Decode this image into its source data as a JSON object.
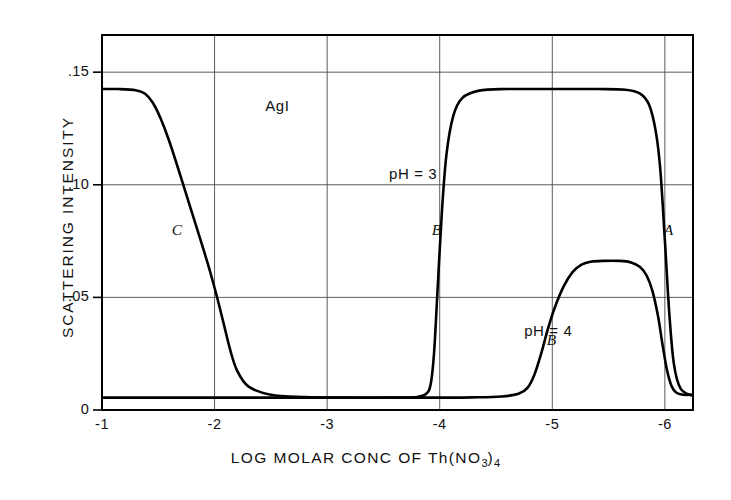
{
  "chart_data": {
    "type": "line",
    "title": "AgI",
    "xlabel": "LOG MOLAR CONC OF Th(NO3)4",
    "xlabel_main": "LOG MOLAR CONC OF  Th(NO",
    "xlabel_sub1": "3",
    "xlabel_mid": ")",
    "xlabel_sub2": "4",
    "ylabel": "SCATTERING INTENSITY",
    "xlim": [
      -1,
      -6.25
    ],
    "ylim": [
      0,
      0.1665
    ],
    "grid": true,
    "legend_position": "none",
    "xticks": [
      -1,
      -2,
      -3,
      -4,
      -5,
      -6
    ],
    "xtick_labels": [
      "-1",
      "-2",
      "-3",
      "-4",
      "-5",
      "-6"
    ],
    "yticks": [
      0,
      0.05,
      0.1,
      0.15
    ],
    "ytick_labels": [
      "0",
      ".05",
      ".10",
      ".15"
    ],
    "series": [
      {
        "name": "pH = 3",
        "label": "pH = 3",
        "color": "#000000",
        "x": [
          -1.0,
          -1.15,
          -1.3,
          -1.38,
          -1.45,
          -1.52,
          -1.6,
          -1.7,
          -1.8,
          -1.9,
          -1.96,
          -2.02,
          -2.08,
          -2.14,
          -2.2,
          -2.3,
          -2.5,
          -2.8,
          -3.2,
          -3.6,
          -3.8,
          -3.88,
          -3.92,
          -3.95,
          -3.98,
          -4.02,
          -4.06,
          -4.12,
          -4.2,
          -4.35,
          -4.6,
          -5.0,
          -5.4,
          -5.65,
          -5.78,
          -5.86,
          -5.92,
          -5.96,
          -6.0,
          -6.04,
          -6.08,
          -6.14,
          -6.25
        ],
        "y": [
          0.1425,
          0.1425,
          0.142,
          0.1405,
          0.1365,
          0.1295,
          0.119,
          0.1035,
          0.0875,
          0.0715,
          0.0615,
          0.0505,
          0.0385,
          0.0265,
          0.0175,
          0.0105,
          0.0068,
          0.0058,
          0.0055,
          0.0055,
          0.0058,
          0.0072,
          0.0115,
          0.0255,
          0.0525,
          0.0885,
          0.1135,
          0.1305,
          0.1385,
          0.1418,
          0.1425,
          0.1425,
          0.1425,
          0.1422,
          0.1405,
          0.1355,
          0.1235,
          0.1065,
          0.0755,
          0.0425,
          0.0205,
          0.0095,
          0.0062
        ]
      },
      {
        "name": "pH = 4",
        "label": "pH = 4",
        "color": "#000000",
        "x": [
          -1.0,
          -2.0,
          -3.0,
          -3.5,
          -4.0,
          -4.3,
          -4.55,
          -4.7,
          -4.78,
          -4.84,
          -4.9,
          -4.96,
          -5.02,
          -5.1,
          -5.18,
          -5.26,
          -5.34,
          -5.45,
          -5.6,
          -5.7,
          -5.78,
          -5.84,
          -5.89,
          -5.94,
          -5.98,
          -6.02,
          -6.06,
          -6.1,
          -6.16,
          -6.25
        ],
        "y": [
          0.0055,
          0.0055,
          0.0055,
          0.0055,
          0.0055,
          0.0056,
          0.006,
          0.0072,
          0.0098,
          0.0155,
          0.0248,
          0.0358,
          0.0452,
          0.0548,
          0.0612,
          0.0645,
          0.0658,
          0.0662,
          0.0662,
          0.0655,
          0.0635,
          0.0595,
          0.0528,
          0.0415,
          0.0288,
          0.0175,
          0.0105,
          0.0078,
          0.0068,
          0.0068
        ]
      }
    ],
    "annotations": [
      {
        "text": "AgI",
        "x": -2.45,
        "y": 0.1345,
        "style": "plain",
        "name": "sample-label"
      },
      {
        "text": "pH = 3",
        "x": -3.55,
        "y": 0.1045,
        "style": "plain",
        "name": "ph3-label"
      },
      {
        "text": "pH = 4",
        "x": -4.75,
        "y": 0.0345,
        "style": "plain",
        "name": "ph4-label"
      },
      {
        "text": "C",
        "x": -1.62,
        "y": 0.0795,
        "style": "italic",
        "name": "curve-label-c"
      },
      {
        "text": "B",
        "x": -3.93,
        "y": 0.0795,
        "style": "italic",
        "name": "curve-label-b-upper"
      },
      {
        "text": "B",
        "x": -4.95,
        "y": 0.0305,
        "style": "italic",
        "name": "curve-label-b-lower"
      },
      {
        "text": "A",
        "x": -5.99,
        "y": 0.0795,
        "style": "italic",
        "name": "curve-label-a"
      }
    ]
  }
}
